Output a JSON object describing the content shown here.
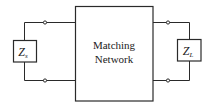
{
  "diagram": {
    "type": "two-port circuit block diagram",
    "center_block": {
      "line1": "Matching",
      "line2": "Network"
    },
    "source_impedance": {
      "symbol": "Z",
      "subscript": "s"
    },
    "load_impedance": {
      "symbol": "Z",
      "subscript": "L"
    },
    "colors": {
      "stroke": "#2a2a2a",
      "background": "#ffffff"
    }
  }
}
